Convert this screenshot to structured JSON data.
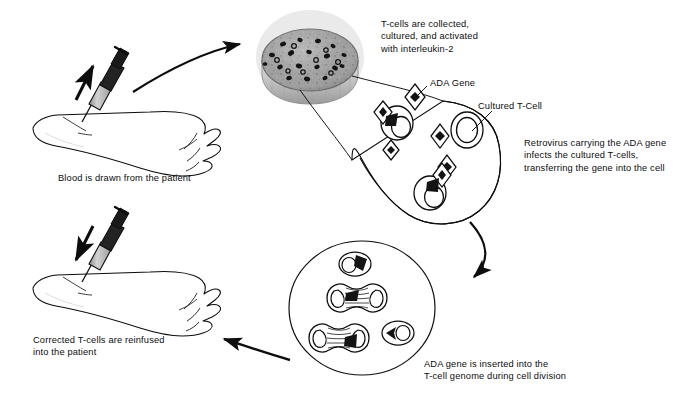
{
  "diagram": {
    "background_color": "#ffffff",
    "ink_color": "#0d0d0d",
    "dish_medium_color": "#9a9a9a",
    "syringe_barrel_color": "#b3b3b3",
    "steps": [
      {
        "id": "blood-draw",
        "caption": "Blood is drawn from the patient"
      },
      {
        "id": "culture",
        "caption": "T-cells are collected,\ncultured, and activated\nwith interleukin-2"
      },
      {
        "id": "infection",
        "caption": "Retrovirus carrying the ADA gene\ninfects the cultured T-cells,\ntransferring the gene into the cell"
      },
      {
        "id": "integration",
        "caption": "ADA gene is inserted into the\nT-cell genome during cell division"
      },
      {
        "id": "reinfusion",
        "caption": "Corrected T-cells are reinfused\ninto the patient"
      }
    ],
    "labels": {
      "ada_gene": "ADA Gene",
      "cultured_tcell": "Cultured T-Cell"
    },
    "icons": {
      "syringe_draw": "syringe-icon",
      "syringe_inject": "syringe-icon",
      "arm_upper": "forearm-icon",
      "arm_lower": "forearm-icon",
      "petri_dish": "petri-dish-icon",
      "arrow_to_dish": "curved-arrow-icon",
      "arrow_to_division": "curved-arrow-icon",
      "arrow_to_patient": "curved-arrow-icon",
      "retrovirus": "diamond-virus-icon",
      "tcell": "tcell-icon",
      "dividing_cell": "mitosis-cell-icon"
    }
  }
}
